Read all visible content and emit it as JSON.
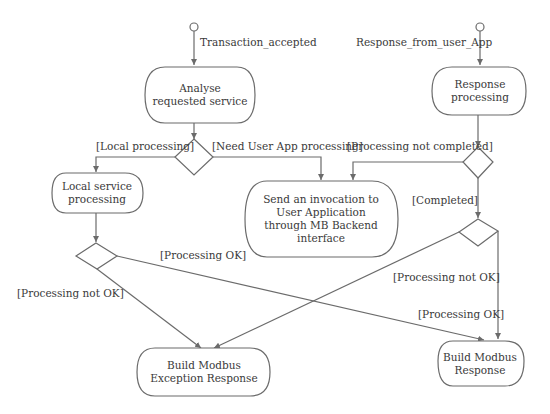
{
  "diagram": {
    "type": "activity-diagram",
    "colors": {
      "line": "#6b6b6b",
      "text": "#3a3a3a",
      "background": "#ffffff"
    },
    "start_events": [
      {
        "id": "start1",
        "label": "Transaction_accepted"
      },
      {
        "id": "start2",
        "label": "Response_from_user_App"
      }
    ],
    "activities": {
      "analyse": [
        "Analyse",
        "requested service"
      ],
      "response_processing": [
        "Response",
        "processing"
      ],
      "local_service": [
        "Local service",
        "processing"
      ],
      "send_invocation": [
        "Send an invocation to",
        "User Application",
        "through MB Backend",
        "interface"
      ],
      "build_exception": [
        "Build Modbus",
        "Exception Response"
      ],
      "build_response": [
        "Build Modbus",
        "Response"
      ]
    },
    "guards": {
      "local_processing": "[Local processing]",
      "need_user_app": "[Need User App processing]",
      "processing_not_completed": "[Processing not completed]",
      "completed": "[Completed]",
      "processing_ok_left": "[Processing OK]",
      "processing_not_ok_left": "[Processing not OK]",
      "processing_not_ok_right": "[Processing  not OK]",
      "processing_ok_right": "[Processing OK]"
    }
  }
}
